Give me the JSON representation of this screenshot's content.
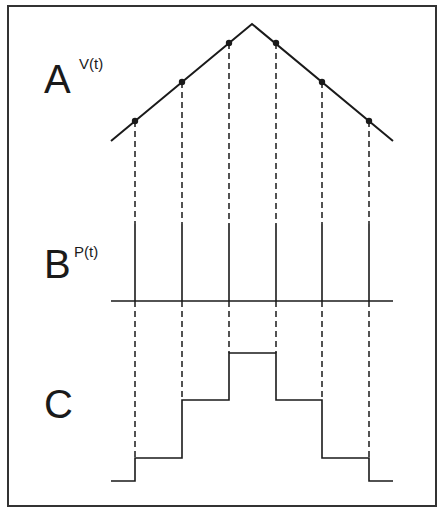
{
  "figure": {
    "panels": [
      {
        "id": "A",
        "label": "A",
        "function_label": "V(t)",
        "description": "triangular ramp signal sampled at discrete points"
      },
      {
        "id": "B",
        "label": "B",
        "function_label": "P(t)",
        "description": "sampling pulses (impulse train)"
      },
      {
        "id": "C",
        "label": "C",
        "function_label": "",
        "description": "sample-and-hold staircase reconstruction"
      }
    ],
    "colors": {
      "line": "#1a1a1a",
      "frame": "#333333",
      "background": "#ffffff"
    },
    "frame": {
      "x": 8,
      "y": 6,
      "width": 428,
      "height": 500
    },
    "signal_A": {
      "start": [
        111,
        141
      ],
      "peak": [
        252,
        24
      ],
      "end": [
        393,
        141
      ],
      "sample_points": [
        [
          135,
          121
        ],
        [
          182,
          82
        ],
        [
          229,
          43
        ],
        [
          276,
          43
        ],
        [
          322,
          82
        ],
        [
          369,
          121
        ]
      ]
    },
    "pulses_B": {
      "axis_y": 301,
      "axis_x_range": [
        111,
        393
      ],
      "pulse_top_y": 224,
      "pulse_x": [
        135,
        182,
        229,
        276,
        322,
        369
      ]
    },
    "staircase_C": {
      "base_y": 481,
      "levels_y": [
        458,
        400,
        353,
        353,
        400,
        458
      ],
      "points": [
        [
          111,
          481
        ],
        [
          135,
          481
        ],
        [
          135,
          458
        ],
        [
          182,
          458
        ],
        [
          182,
          400
        ],
        [
          229,
          400
        ],
        [
          229,
          353
        ],
        [
          276,
          353
        ],
        [
          276,
          400
        ],
        [
          322,
          400
        ],
        [
          322,
          458
        ],
        [
          369,
          458
        ],
        [
          369,
          481
        ],
        [
          393,
          481
        ]
      ]
    }
  }
}
